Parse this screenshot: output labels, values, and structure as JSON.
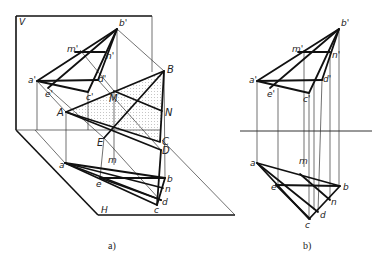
{
  "figure": {
    "panel_a": {
      "caption": "a)",
      "plane_labels": {
        "vertical": "V",
        "horizontal": "H"
      },
      "space_points": {
        "A": "A",
        "B": "B",
        "C": "C",
        "D": "D",
        "M": "M",
        "N": "N",
        "E": "E"
      },
      "front_projection_labels": {
        "a": "a'",
        "b": "b'",
        "c": "c'",
        "d": "d'",
        "m": "m'",
        "n": "n'",
        "e": "e'"
      },
      "top_projection_labels": {
        "a": "a",
        "b": "b",
        "c": "c",
        "d": "d",
        "m": "m",
        "n": "n",
        "e": "e"
      }
    },
    "panel_b": {
      "caption": "b)",
      "front_projection_labels": {
        "a": "a'",
        "b": "b'",
        "c": "c'",
        "d": "d'",
        "m": "m'",
        "n": "n'",
        "e": "e'"
      },
      "top_projection_labels": {
        "a": "a",
        "b": "b",
        "c": "c",
        "d": "d",
        "m": "m",
        "n": "n",
        "e": "e"
      }
    },
    "colors": {
      "line": "#111111",
      "hatch": "#9a9a9a",
      "background": "#ffffff"
    }
  }
}
